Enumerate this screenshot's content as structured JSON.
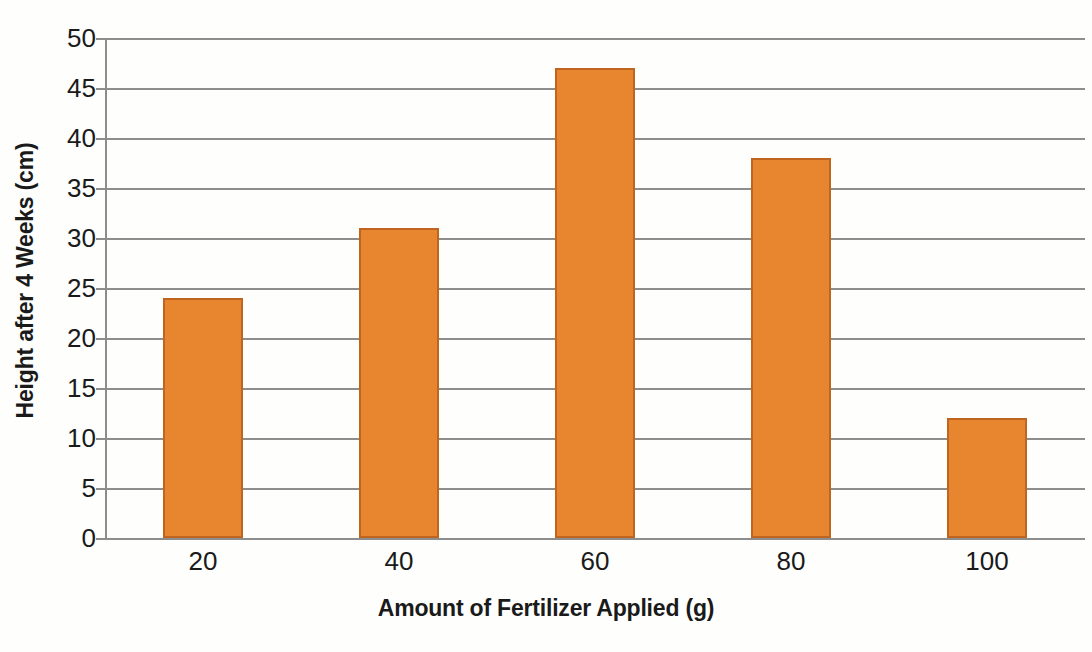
{
  "chart_data": {
    "type": "bar",
    "title": "",
    "categories": [
      "20",
      "40",
      "60",
      "80",
      "100"
    ],
    "values": [
      24,
      31,
      47,
      38,
      12
    ],
    "series": [
      {
        "name": "Height after 4 Weeks (cm)",
        "values": [
          24,
          31,
          47,
          38,
          12
        ]
      }
    ],
    "xlabel": "Amount of Fertilizer Applied (g)",
    "ylabel": "Height after 4 Weeks (cm)",
    "ylim": [
      0,
      50
    ],
    "ytick_step": 5,
    "yticks": [
      "50",
      "45",
      "40",
      "35",
      "30",
      "25",
      "20",
      "15",
      "10",
      "5",
      "0"
    ],
    "ytick_values": [
      50,
      45,
      40,
      35,
      30,
      25,
      20,
      15,
      10,
      5,
      0
    ],
    "grid": true,
    "legend": false,
    "legend_position": "none",
    "bar_color": "#e8852f",
    "bar_border_color": "#bf6520",
    "gridline_color": "#8d8d8d",
    "axis_color": "#8d8d8d",
    "text_color": "#1a1a1a",
    "background_color": "#fefefd"
  }
}
